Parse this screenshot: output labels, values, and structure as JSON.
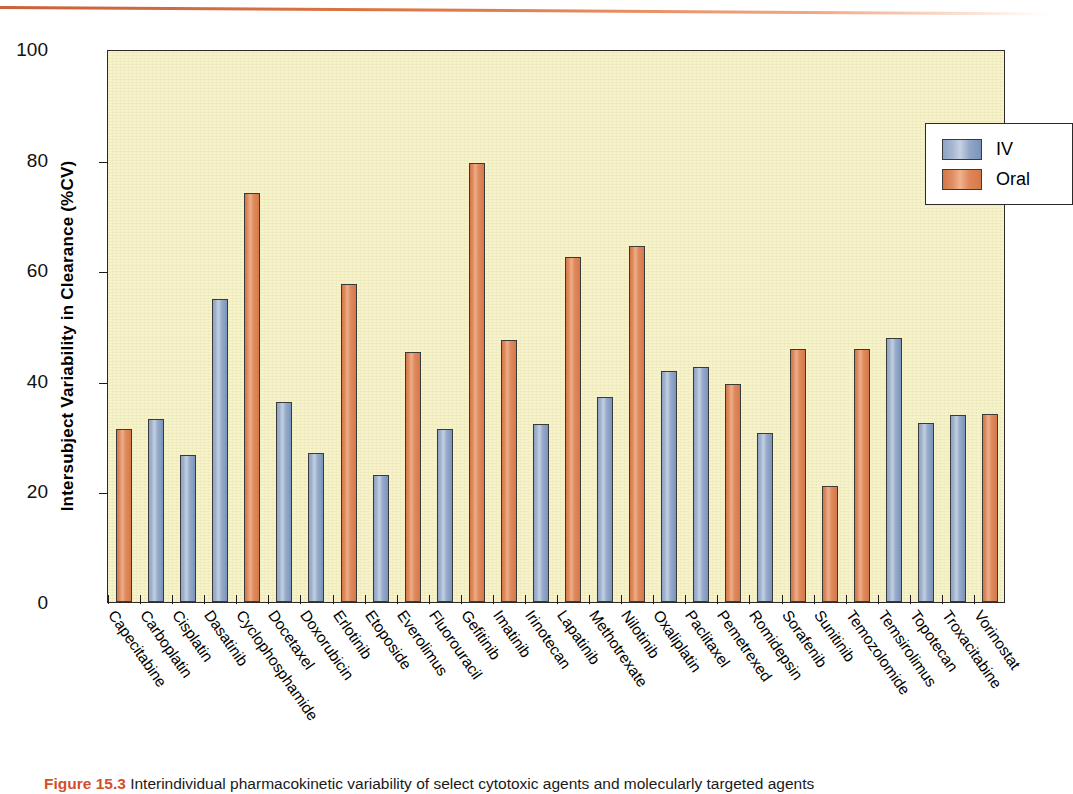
{
  "figure": {
    "caption_label": "Figure 15.3",
    "caption_text": "Interindividual pharmacokinetic variability of select cytotoxic agents and molecularly targeted agents",
    "accent_color": "#d2502a",
    "plot_background": "#f6f2c9"
  },
  "legend": {
    "position": "top-right",
    "entries": [
      {
        "label": "IV",
        "color": "#7d96be"
      },
      {
        "label": "Oral",
        "color": "#dd7f52"
      }
    ]
  },
  "chart_data": {
    "type": "bar",
    "title": "",
    "xlabel": "",
    "ylabel": "Intersubject Variability in Clearance (%CV)",
    "ylim": [
      0,
      100
    ],
    "yticks": [
      0,
      20,
      40,
      60,
      80,
      100
    ],
    "grid": false,
    "legend_position": "top-right",
    "categories": [
      "Capecitabine",
      "Carboplatin",
      "Cisplatin",
      "Dasatinib",
      "Cyclophosphamide",
      "Docetaxel",
      "Doxorubicin",
      "Erlotinib",
      "Etoposide",
      "Everolimus",
      "Fluorouracil",
      "Gefitinib",
      "Imatinib",
      "Irinotecan",
      "Lapatinib",
      "Methotrexate",
      "Nilotinib",
      "Oxaliplatin",
      "Paclitaxel",
      "Pemetrexed",
      "Romidepsin",
      "Sorafenib",
      "Sunitinib",
      "Temozolomide",
      "Temsirolimus",
      "Topotecan",
      "Troxacitabine",
      "Vorinostat"
    ],
    "route": [
      "Oral",
      "IV",
      "IV",
      "Oral",
      "IV",
      "IV",
      "IV",
      "Oral",
      "IV",
      "Oral",
      "IV",
      "Oral",
      "Oral",
      "IV",
      "Oral",
      "IV",
      "Oral",
      "IV",
      "IV",
      "Oral",
      "IV",
      "Oral",
      "Oral",
      "Oral",
      "IV",
      "IV",
      "IV",
      "Oral"
    ],
    "values": [
      31.2,
      33.1,
      26.6,
      54.8,
      74.0,
      36.1,
      27.0,
      57.5,
      23.0,
      45.2,
      31.2,
      79.3,
      47.3,
      32.2,
      62.4,
      37.1,
      64.4,
      41.7,
      42.5,
      39.5,
      30.6,
      45.7,
      20.9,
      45.8,
      47.7,
      32.3,
      33.9,
      34.0
    ],
    "series": [
      {
        "name": "IV",
        "color": "#7d96be",
        "points": [
          {
            "category": "Carboplatin",
            "value": 33.1
          },
          {
            "category": "Cisplatin",
            "value": 26.6
          },
          {
            "category": "Cyclophosphamide",
            "value": 36.1
          },
          {
            "category": "Docetaxel",
            "value": 27.0
          },
          {
            "category": "Doxorubicin",
            "value": 57.5
          },
          {
            "category": "Etoposide",
            "value": 23.0
          },
          {
            "category": "Fluorouracil",
            "value": 31.2
          },
          {
            "category": "Irinotecan",
            "value": 32.2
          },
          {
            "category": "Methotrexate",
            "value": 37.1
          },
          {
            "category": "Oxaliplatin",
            "value": 41.7
          },
          {
            "category": "Paclitaxel",
            "value": 42.5
          },
          {
            "category": "Romidepsin",
            "value": 30.6
          },
          {
            "category": "Temsirolimus",
            "value": 45.8
          },
          {
            "category": "Topotecan",
            "value": 47.7
          },
          {
            "category": "Troxacitabine",
            "value": 32.3
          }
        ]
      },
      {
        "name": "Oral",
        "color": "#dd7f52",
        "points": [
          {
            "category": "Capecitabine",
            "value": 31.2
          },
          {
            "category": "Dasatinib",
            "value": 54.8
          },
          {
            "category": "Cyclophosphamide",
            "value": 74.0
          },
          {
            "category": "Erlotinib",
            "value": 57.5
          },
          {
            "category": "Everolimus",
            "value": 45.2
          },
          {
            "category": "Gefitinib",
            "value": 79.3
          },
          {
            "category": "Imatinib",
            "value": 47.3
          },
          {
            "category": "Lapatinib",
            "value": 62.4
          },
          {
            "category": "Nilotinib",
            "value": 64.4
          },
          {
            "category": "Pemetrexed",
            "value": 39.5
          },
          {
            "category": "Sorafenib",
            "value": 45.7
          },
          {
            "category": "Sunitinib",
            "value": 20.9
          },
          {
            "category": "Temozolomide",
            "value": 45.8
          },
          {
            "category": "Vorinostat",
            "value": 34.0
          }
        ]
      }
    ],
    "bars": [
      {
        "label": "Capecitabine",
        "value": 31.2,
        "route": "Oral"
      },
      {
        "label": "Carboplatin",
        "value": 33.1,
        "route": "IV"
      },
      {
        "label": "Cisplatin",
        "value": 26.6,
        "route": "IV"
      },
      {
        "label": "Dasatinib",
        "value": 54.8,
        "route": "IV"
      },
      {
        "label": "Cyclophosphamide",
        "value": 74.0,
        "route": "Oral"
      },
      {
        "label": "Docetaxel",
        "value": 36.1,
        "route": "IV"
      },
      {
        "label": "Doxorubicin",
        "value": 27.0,
        "route": "IV"
      },
      {
        "label": "Erlotinib",
        "value": 57.5,
        "route": "Oral"
      },
      {
        "label": "Etoposide",
        "value": 23.0,
        "route": "IV"
      },
      {
        "label": "Everolimus",
        "value": 45.2,
        "route": "Oral"
      },
      {
        "label": "Fluorouracil",
        "value": 31.2,
        "route": "IV"
      },
      {
        "label": "Gefitinib",
        "value": 79.3,
        "route": "Oral"
      },
      {
        "label": "Imatinib",
        "value": 47.3,
        "route": "Oral"
      },
      {
        "label": "Irinotecan",
        "value": 32.2,
        "route": "IV"
      },
      {
        "label": "Lapatinib",
        "value": 62.4,
        "route": "Oral"
      },
      {
        "label": "Methotrexate",
        "value": 37.1,
        "route": "IV"
      },
      {
        "label": "Nilotinib",
        "value": 64.4,
        "route": "Oral"
      },
      {
        "label": "Oxaliplatin",
        "value": 41.7,
        "route": "IV"
      },
      {
        "label": "Paclitaxel",
        "value": 42.5,
        "route": "IV"
      },
      {
        "label": "Pemetrexed",
        "value": 39.5,
        "route": "Oral"
      },
      {
        "label": "Romidepsin",
        "value": 30.6,
        "route": "IV"
      },
      {
        "label": "Sorafenib",
        "value": 45.7,
        "route": "Oral"
      },
      {
        "label": "Sunitinib",
        "value": 20.9,
        "route": "Oral"
      },
      {
        "label": "Temozolomide",
        "value": 45.8,
        "route": "Oral"
      },
      {
        "label": "Temsirolimus",
        "value": 47.7,
        "route": "IV"
      },
      {
        "label": "Topotecan",
        "value": 32.3,
        "route": "IV"
      },
      {
        "label": "Troxacitabine",
        "value": 33.9,
        "route": "IV"
      },
      {
        "label": "Vorinostat",
        "value": 34.0,
        "route": "Oral"
      }
    ]
  }
}
